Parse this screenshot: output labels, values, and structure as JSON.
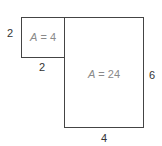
{
  "diagram": {
    "stroke_color": "#444444",
    "small_square": {
      "side_left_label": "2",
      "side_bottom_label": "2",
      "area_label": "A = 4",
      "area_var": "A",
      "area_value": " = 4"
    },
    "large_rectangle": {
      "side_right_label": "6",
      "side_bottom_label": "4",
      "area_label": "A = 24",
      "area_var": "A",
      "area_value": " = 24"
    }
  }
}
